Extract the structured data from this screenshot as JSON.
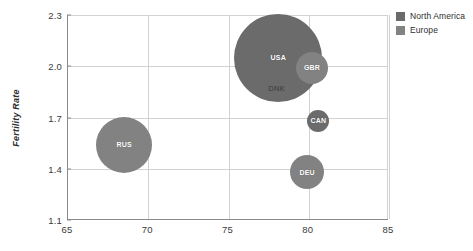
{
  "chart_data": {
    "type": "scatter",
    "title": "",
    "xlabel": "",
    "ylabel": "Fertility Rate",
    "xlim": [
      65,
      85
    ],
    "ylim": [
      1.1,
      2.3
    ],
    "xticks": [
      "65",
      "70",
      "75",
      "80",
      "85"
    ],
    "yticks": [
      "2.3",
      "2.0",
      "1.7",
      "1.4",
      "1.1"
    ],
    "grid": true,
    "legend_position": "top-right",
    "bubble_size_encoding": "population",
    "series": [
      {
        "name": "North America",
        "color": "#6b6b6b",
        "points": [
          {
            "label": "USA",
            "x": 78.1,
            "y": 2.05,
            "size": 44
          },
          {
            "label": "CAN",
            "x": 80.6,
            "y": 1.68,
            "size": 11
          }
        ]
      },
      {
        "name": "Europe",
        "color": "#828282",
        "points": [
          {
            "label": "GBR",
            "x": 80.2,
            "y": 1.99,
            "size": 16
          },
          {
            "label": "DEU",
            "x": 79.9,
            "y": 1.38,
            "size": 17
          },
          {
            "label": "RUS",
            "x": 68.5,
            "y": 1.54,
            "size": 28
          },
          {
            "label": "DNK",
            "x": 78.0,
            "y": 1.87,
            "size": 0
          }
        ]
      }
    ]
  },
  "legend": {
    "items": [
      {
        "label": "North America",
        "color": "#6b6b6b"
      },
      {
        "label": "Europe",
        "color": "#828282"
      }
    ]
  },
  "axes": {
    "y_title": "Fertility Rate",
    "x_tick_labels": [
      "65",
      "70",
      "75",
      "80",
      "85"
    ],
    "y_tick_labels": [
      "2.3",
      "2.0",
      "1.7",
      "1.4",
      "1.1"
    ]
  },
  "colors": {
    "north_america": "#6b6b6b",
    "europe": "#828282",
    "grid": "#d2d2d2",
    "axis": "#8a8a8a",
    "text": "#3a3a3a",
    "background": "#ffffff"
  }
}
